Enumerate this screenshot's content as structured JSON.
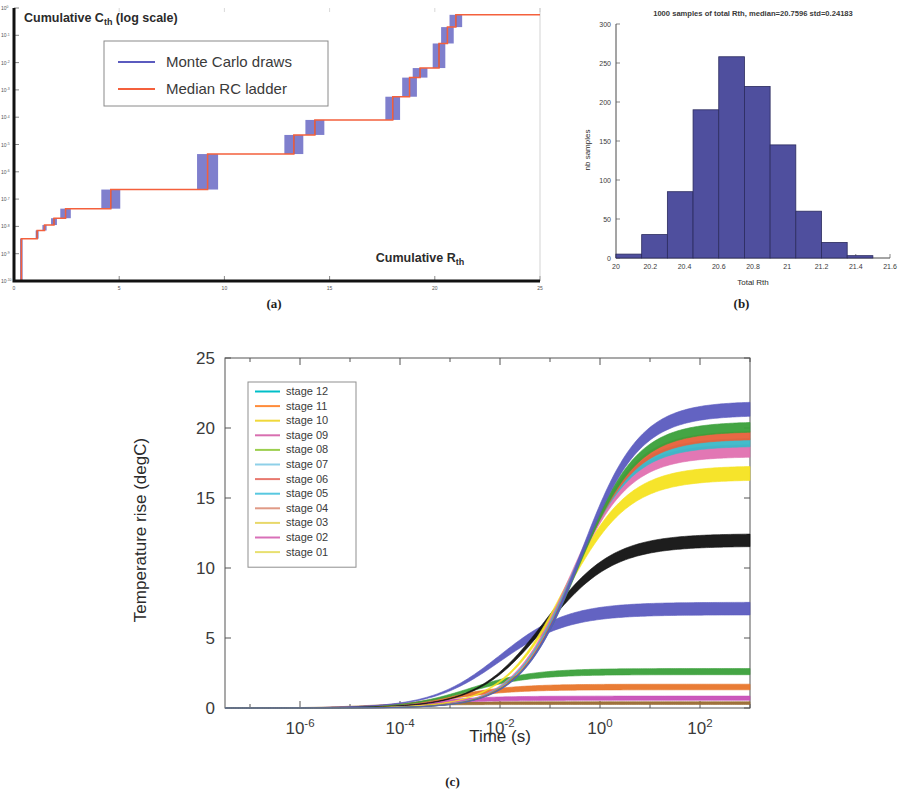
{
  "figure": {
    "captions": {
      "a": "(a)",
      "b": "(b)",
      "c": "(c)"
    }
  },
  "panel_a": {
    "ylabel": "Cumulative C",
    "ylabel_sub": "th",
    "ylabel_tail": " (log scale)",
    "xlabel": "Cumulative R",
    "xlabel_sub": "th",
    "legend": [
      {
        "label": "Monte Carlo draws",
        "color": "#5b5bbf"
      },
      {
        "label": "Median RC ladder",
        "color": "#f4603c"
      }
    ]
  },
  "panel_b": {
    "title": "1000 samples of total Rth, median=20.7596 std=0.24183",
    "xlabel": "Total Rth",
    "ylabel": "nb samples",
    "bar_color": "#4f4f9e"
  },
  "panel_c": {
    "xlabel": "Time (s)",
    "ylabel": "Temperature rise (degC)",
    "legend": [
      {
        "label": "stage 12",
        "color": "#00bfc8"
      },
      {
        "label": "stage 11",
        "color": "#ff8c3a"
      },
      {
        "label": "stage 10",
        "color": "#f0d83a"
      },
      {
        "label": "stage 09",
        "color": "#d86fb0"
      },
      {
        "label": "stage 08",
        "color": "#9ccf4f"
      },
      {
        "label": "stage 07",
        "color": "#8fd0e8"
      },
      {
        "label": "stage 06",
        "color": "#e8796f"
      },
      {
        "label": "stage 05",
        "color": "#58c8e0"
      },
      {
        "label": "stage 04",
        "color": "#e09a86"
      },
      {
        "label": "stage 03",
        "color": "#e8d86a"
      },
      {
        "label": "stage 02",
        "color": "#d870b8"
      },
      {
        "label": "stage 01",
        "color": "#e8e070"
      }
    ]
  },
  "chart_data": [
    {
      "type": "line",
      "panel": "a",
      "title": "",
      "xlabel": "Cumulative Rth",
      "ylabel": "Cumulative Cth (log scale)",
      "xlim": [
        0,
        25
      ],
      "ylim_log": [
        1e-10,
        1.0
      ],
      "yscale": "log",
      "xticks": [
        0,
        5,
        10,
        15,
        20,
        25
      ],
      "yticks": [
        "10^-10",
        "10^-9",
        "10^-8",
        "10^-7",
        "10^-6",
        "10^-5",
        "10^-4",
        "10^-3",
        "10^-2",
        "10^-1",
        "10^0"
      ],
      "grid": false,
      "legend_position": "upper-left",
      "description": "Cumulative RC ladder staircase; median red curve with blue Monte Carlo uncertainty bands at each riser",
      "series": [
        {
          "name": "Median RC ladder",
          "color": "#f4603c",
          "steps_x": [
            0.05,
            0.35,
            1.1,
            1.45,
            1.9,
            2.45,
            4.6,
            9.2,
            13.3,
            14.3,
            18.0,
            18.8,
            19.3,
            20.2,
            20.6,
            21.0
          ],
          "steps_y_decade": [
            0.0,
            1.55,
            1.85,
            2.05,
            2.3,
            2.65,
            3.35,
            4.65,
            5.35,
            5.9,
            6.75,
            7.45,
            7.8,
            8.7,
            9.3,
            9.75
          ]
        },
        {
          "name": "Monte Carlo draws",
          "color": "#5b5bbf",
          "band_half_width_x": [
            0.05,
            0.06,
            0.07,
            0.1,
            0.14,
            0.25,
            0.45,
            0.5,
            0.45,
            0.45,
            0.35,
            0.35,
            0.35,
            0.3,
            0.3,
            0.3
          ]
        }
      ]
    },
    {
      "type": "bar",
      "panel": "b",
      "title": "1000 samples of total Rth, median=20.7596 std=0.24183",
      "xlabel": "Total Rth",
      "ylabel": "nb samples",
      "xlim": [
        20,
        21.6
      ],
      "ylim": [
        0,
        300
      ],
      "xticks": [
        20,
        20.2,
        20.4,
        20.6,
        20.8,
        21,
        21.2,
        21.4,
        21.6
      ],
      "xtick_labels": [
        "20",
        "20.2",
        "20.4",
        "20.6",
        "20.8",
        "21",
        "21.2",
        "21.4",
        "21.6"
      ],
      "yticks": [
        0,
        50,
        100,
        150,
        200,
        250,
        300
      ],
      "grid": false,
      "bin_edges": [
        20.0,
        20.15,
        20.3,
        20.45,
        20.6,
        20.75,
        20.9,
        21.05,
        21.2,
        21.35,
        21.5
      ],
      "values": [
        5,
        30,
        85,
        190,
        258,
        220,
        145,
        60,
        20,
        3
      ],
      "color": "#4f4f9e",
      "edge_color": "#2b2b5e",
      "median": 20.7596,
      "std": 0.24183,
      "n_samples": 1000
    },
    {
      "type": "line",
      "panel": "c",
      "title": "",
      "xlabel": "Time (s)",
      "ylabel": "Temperature rise (degC)",
      "xscale": "log",
      "xlim_log": [
        -7.5,
        3.0
      ],
      "ylim": [
        0,
        25
      ],
      "xticks": [
        "10^-6",
        "10^-4",
        "10^-2",
        "10^0",
        "10^2"
      ],
      "yticks": [
        0,
        5,
        10,
        15,
        20,
        25
      ],
      "grid": false,
      "legend_position": "upper-left",
      "description": "Cumulative temperature-rise step responses for 12 RC stages, each drawn as a Monte Carlo band",
      "series": [
        {
          "name": "stage 12",
          "color": "#5b5bbf",
          "plateau": 21.4,
          "knee_log_t": -0.4,
          "rise_decades": 1.4,
          "band": 0.5
        },
        {
          "name": "stage 11",
          "color": "#3aa03a",
          "plateau": 20.1,
          "knee_log_t": -0.45,
          "rise_decades": 1.4,
          "band": 0.35
        },
        {
          "name": "stage 10",
          "color": "#e8603a",
          "plateau": 19.5,
          "knee_log_t": -0.5,
          "rise_decades": 1.4,
          "band": 0.3
        },
        {
          "name": "stage 09",
          "color": "#3ab8c8",
          "plateau": 19.0,
          "knee_log_t": -0.55,
          "rise_decades": 1.4,
          "band": 0.3
        },
        {
          "name": "stage 08",
          "color": "#e070b0",
          "plateau": 18.4,
          "knee_log_t": -0.6,
          "rise_decades": 1.4,
          "band": 0.45
        },
        {
          "name": "stage 07",
          "color": "#f5e320",
          "plateau": 16.8,
          "knee_log_t": -0.7,
          "rise_decades": 1.5,
          "band": 0.5
        },
        {
          "name": "stage 06",
          "color": "#111111",
          "plateau": 12.0,
          "knee_log_t": -1.1,
          "rise_decades": 1.6,
          "band": 0.45
        },
        {
          "name": "stage 05",
          "color": "#5b5bbf",
          "plateau": 7.1,
          "knee_log_t": -2.0,
          "rise_decades": 1.6,
          "band": 0.45
        },
        {
          "name": "stage 04",
          "color": "#3aa03a",
          "plateau": 2.6,
          "knee_log_t": -2.6,
          "rise_decades": 1.5,
          "band": 0.22
        },
        {
          "name": "stage 03",
          "color": "#e8752a",
          "plateau": 1.5,
          "knee_log_t": -3.0,
          "rise_decades": 1.5,
          "band": 0.2
        },
        {
          "name": "stage 02",
          "color": "#c850b8",
          "plateau": 0.7,
          "knee_log_t": -3.6,
          "rise_decades": 1.5,
          "band": 0.15
        },
        {
          "name": "stage 01",
          "color": "#9a6a30",
          "plateau": 0.35,
          "knee_log_t": -4.4,
          "rise_decades": 1.5,
          "band": 0.1
        }
      ]
    }
  ]
}
